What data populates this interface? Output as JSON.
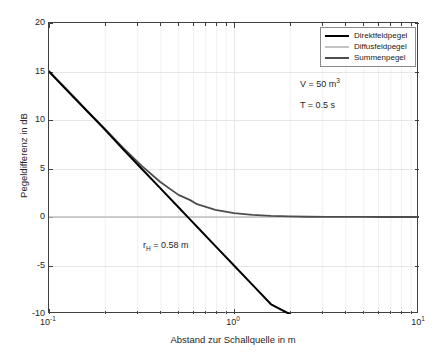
{
  "chart_data": {
    "type": "line",
    "title": "",
    "xlabel": "Abstand zur Schallquelle in m",
    "ylabel": "Pegeldifferenz in dB",
    "xscale": "log",
    "yscale": "linear",
    "xlim": [
      0.1,
      10
    ],
    "ylim": [
      -10,
      20
    ],
    "grid": true,
    "xticks": [
      0.1,
      1,
      10
    ],
    "xticklabels": [
      "10-1",
      "100",
      "101"
    ],
    "yticks": [
      -10,
      -5,
      0,
      5,
      10,
      15,
      20
    ],
    "yticklabels": [
      "-10",
      "-5",
      "0",
      "5",
      "10",
      "15",
      "20"
    ],
    "legend_position": "upper right",
    "annotations": [
      {
        "id": "volume",
        "text": "V = 50 m3",
        "x": 3.0,
        "y": 12.3
      },
      {
        "id": "rt60",
        "text": "T = 0.5 s",
        "x": 3.0,
        "y": 10.1
      },
      {
        "id": "hallradius",
        "text": "rH = 0.58 m",
        "x": 0.34,
        "y": -2.4
      }
    ],
    "series": [
      {
        "name": "Direktfeldpegel",
        "color": "#000000",
        "width": 2.0,
        "x": [
          0.1,
          0.125,
          0.158,
          0.2,
          0.251,
          0.316,
          0.398,
          0.501,
          0.58,
          0.631,
          0.794,
          1.0,
          1.259,
          1.585,
          1.995
        ],
        "y": [
          15.0,
          13.06,
          11.06,
          9.03,
          7.0,
          5.0,
          3.0,
          1.0,
          -0.27,
          -1.0,
          -3.0,
          -5.0,
          -7.0,
          -9.0,
          -10.0
        ]
      },
      {
        "name": "Diffusfeldpegel",
        "color": "#bfbfbf",
        "width": 1.6,
        "x": [
          0.1,
          1.0,
          10.0
        ],
        "y": [
          0.0,
          0.0,
          0.0
        ]
      },
      {
        "name": "Summenpegel",
        "color": "#4d4d4d",
        "width": 1.8,
        "x": [
          0.1,
          0.126,
          0.158,
          0.2,
          0.251,
          0.316,
          0.398,
          0.501,
          0.58,
          0.631,
          0.794,
          1.0,
          1.259,
          1.585,
          1.995,
          2.512,
          3.162,
          3.981,
          5.012,
          6.31,
          7.943,
          10.0
        ],
        "y": [
          15.01,
          13.08,
          11.09,
          9.1,
          7.15,
          5.3,
          3.63,
          2.28,
          1.74,
          1.32,
          0.73,
          0.4,
          0.21,
          0.11,
          0.055,
          0.028,
          0.014,
          0.007,
          0.004,
          0.002,
          0.001,
          0.0
        ]
      }
    ]
  },
  "legend": {
    "entries": [
      {
        "label": "Direktfeldpegel",
        "color": "#000000"
      },
      {
        "label": "Diffusfeldpegel",
        "color": "#c4c4c4"
      },
      {
        "label": "Summenpegel",
        "color": "#4d4d4d"
      }
    ]
  },
  "axes": {
    "ylabel": "Pegeldifferenz in dB",
    "xlabel": "Abstand zur Schallquelle in m",
    "yticks": [
      "20",
      "15",
      "10",
      "5",
      "0",
      "-5",
      "-10"
    ],
    "xticks": [
      {
        "base": "10",
        "exp": "-1"
      },
      {
        "base": "10",
        "exp": "0"
      },
      {
        "base": "10",
        "exp": "1"
      }
    ]
  },
  "annotations": {
    "volume_base": "V = 50 m",
    "volume_exp": "3",
    "rt": "T = 0.5 s",
    "rh_pre": "r",
    "rh_sub": "H",
    "rh_post": " = 0.58 m"
  },
  "colors": {
    "direct": "#000000",
    "diffuse": "#c4c4c4",
    "sum": "#4d4d4d",
    "grid": "#e6e6e6",
    "minor_grid": "#f0f0f0",
    "axis": "#404040",
    "text": "#262626",
    "background": "#ffffff"
  }
}
